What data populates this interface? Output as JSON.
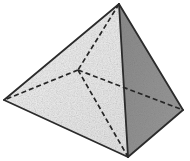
{
  "figure": {
    "kind": "geometric-solid-illustration",
    "shape_name": "square pyramid",
    "canvas": {
      "width": 190,
      "height": 161
    },
    "background_color": "#ffffff",
    "edge_color": "#2b2b2b",
    "hidden_edge_color": "#262626",
    "edge_width": 1.8,
    "hidden_edge_width": 1.7,
    "hidden_edge_dash": "5 3",
    "vertices": {
      "apex": {
        "label": "apex",
        "x": 119,
        "y": 4,
        "hidden": false
      },
      "base_left": {
        "label": "base-left",
        "x": 4,
        "y": 100,
        "hidden": false
      },
      "base_front": {
        "label": "base-front",
        "x": 128,
        "y": 157,
        "hidden": false
      },
      "base_right": {
        "label": "base-right",
        "x": 183,
        "y": 110,
        "hidden": false
      },
      "base_back": {
        "label": "base-back-hidden",
        "x": 78,
        "y": 70,
        "hidden": true
      }
    },
    "faces": [
      {
        "name": "face-front-left",
        "points": "119,4 4,100 128,157",
        "fill": "#efefef",
        "shading": "light-speckled"
      },
      {
        "name": "face-front-right",
        "points": "119,4 128,157 183,110",
        "fill": "#8e8e8e",
        "shading": "medium-gray-speckled"
      },
      {
        "name": "face-base-left-visible",
        "points": "4,100 78,70 128,157",
        "fill": "#e8e8e8",
        "shading": "light-speckled"
      },
      {
        "name": "face-base-right-visible",
        "points": "78,70 183,110 128,157",
        "fill": "#9a9a9a",
        "shading": "medium-gray-speckled"
      }
    ],
    "solid_edges": [
      {
        "name": "edge-apex-to-base-left",
        "x1": 119,
        "y1": 4,
        "x2": 4,
        "y2": 100
      },
      {
        "name": "edge-apex-to-base-front",
        "x1": 119,
        "y1": 4,
        "x2": 128,
        "y2": 157
      },
      {
        "name": "edge-apex-to-base-right",
        "x1": 119,
        "y1": 4,
        "x2": 183,
        "y2": 110
      },
      {
        "name": "edge-base-left-front",
        "x1": 4,
        "y1": 100,
        "x2": 128,
        "y2": 157
      },
      {
        "name": "edge-base-front-right",
        "x1": 128,
        "y1": 157,
        "x2": 183,
        "y2": 110
      }
    ],
    "hidden_edges": [
      {
        "name": "hidden-edge-apex-to-base-back",
        "x1": 119,
        "y1": 4,
        "x2": 78,
        "y2": 70
      },
      {
        "name": "hidden-edge-base-back-to-left",
        "x1": 78,
        "y1": 70,
        "x2": 4,
        "y2": 100
      },
      {
        "name": "hidden-edge-base-back-to-right",
        "x1": 78,
        "y1": 70,
        "x2": 183,
        "y2": 110
      },
      {
        "name": "hidden-edge-base-diagonal",
        "x1": 78,
        "y1": 70,
        "x2": 128,
        "y2": 157
      }
    ],
    "labels": []
  }
}
